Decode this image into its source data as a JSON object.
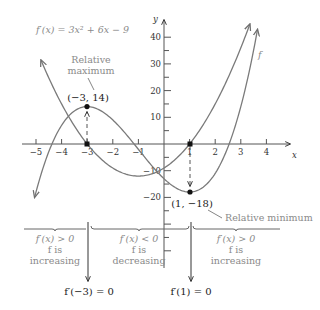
{
  "chart_data": {
    "type": "line",
    "title": "",
    "xlabel": "x",
    "ylabel": "y",
    "xlim": [
      -5.4,
      4.6
    ],
    "ylim": [
      -24,
      46
    ],
    "grid": false,
    "x_ticks": [
      -5,
      -4,
      -3,
      -2,
      -1,
      1,
      2,
      3,
      4
    ],
    "x_tick_labels": [
      "−5",
      "−4",
      "−3",
      "−2",
      "−1",
      "1",
      "2",
      "3",
      "4"
    ],
    "y_ticks": [
      40,
      30,
      20,
      10,
      -10,
      -20
    ],
    "y_tick_labels": [
      "40",
      "30",
      "20",
      "10",
      "−10",
      "−20"
    ],
    "series": [
      {
        "name": "f",
        "label": "f",
        "formula": "x^3 + 3x^2 - 9x - 13",
        "coefficients": [
          1,
          3,
          -9,
          -13
        ],
        "x_range": [
          -5.05,
          3.65
        ],
        "color": "#7a7a7a"
      },
      {
        "name": "f'",
        "label": "f′(x) = 3x² + 6x − 9",
        "formula": "3x^2 + 6x - 9",
        "coefficients": [
          0,
          3,
          6,
          -9
        ],
        "x_range": [
          -4.8,
          3.35
        ],
        "color": "#7a7a7a"
      }
    ],
    "points": [
      {
        "x": -3,
        "y": 14,
        "label": "(−3, 14)",
        "note": "Relative maximum"
      },
      {
        "x": 1,
        "y": -18,
        "label": "(1, −18)",
        "note": "Relative minimum"
      },
      {
        "x": -3,
        "y": 0,
        "label": ""
      },
      {
        "x": 1,
        "y": 0,
        "label": ""
      }
    ],
    "annotations": {
      "derivative_label": "f′(x) = 3x² + 6x − 9",
      "f_label": "f",
      "rel_max_line1": "Relative",
      "rel_max_line2": "maximum",
      "rel_max_point": "(−3, 14)",
      "rel_min": "Relative minimum",
      "rel_min_point": "(1, −18)",
      "x_axis": "x",
      "y_axis": "y"
    },
    "intervals": [
      {
        "condition": "f′(x) > 0",
        "line2": "f is",
        "line3": "increasing"
      },
      {
        "condition": "f′(x) < 0",
        "line2": "f is",
        "line3": "decreasing"
      },
      {
        "condition": "f′(x) > 0",
        "line2": "f is",
        "line3": "increasing"
      }
    ],
    "critical_labels": [
      "f′(−3) = 0",
      "f′(1) = 0"
    ]
  }
}
